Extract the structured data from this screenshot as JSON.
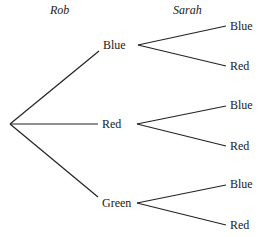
{
  "diagram": {
    "type": "tree",
    "headers": {
      "first": "Rob",
      "second": "Sarah"
    },
    "root": {
      "children": [
        {
          "label": "Blue",
          "children": [
            {
              "label": "Blue"
            },
            {
              "label": "Red"
            }
          ]
        },
        {
          "label": "Red",
          "children": [
            {
              "label": "Blue"
            },
            {
              "label": "Red"
            }
          ]
        },
        {
          "label": "Green",
          "children": [
            {
              "label": "Blue"
            },
            {
              "label": "Red"
            }
          ]
        }
      ]
    }
  }
}
